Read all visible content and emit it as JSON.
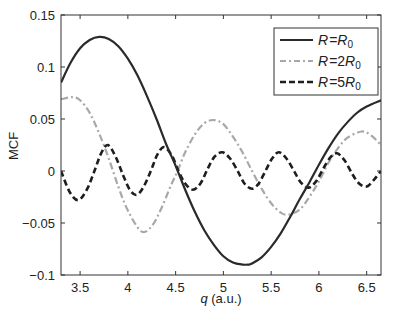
{
  "chart_data": {
    "type": "line",
    "title": "",
    "xlabel": "q (a.u.)",
    "ylabel": "MCF",
    "xlim": [
      3.3,
      6.65
    ],
    "ylim": [
      -0.1,
      0.15
    ],
    "xticks": [
      3.5,
      4,
      4.5,
      5,
      5.5,
      6,
      6.5
    ],
    "xtick_labels": [
      "3.5",
      "4",
      "4.5",
      "5",
      "5.5",
      "6",
      "6.5"
    ],
    "yticks": [
      -0.1,
      -0.05,
      0,
      0.05,
      0.1,
      0.15
    ],
    "ytick_labels": [
      "−0.1",
      "−0.05",
      "0",
      "0.05",
      "0.1",
      "0.15"
    ],
    "grid": false,
    "legend_position": "upper right",
    "series": [
      {
        "name": "R = R0",
        "legend_label": "R = R",
        "legend_sub": "0",
        "legend_prefix": "",
        "style": "solid",
        "color": "#2a2a2a",
        "x": [
          3.3,
          3.4,
          3.5,
          3.6,
          3.7,
          3.8,
          3.9,
          4.0,
          4.1,
          4.2,
          4.3,
          4.4,
          4.5,
          4.6,
          4.7,
          4.8,
          4.9,
          5.0,
          5.1,
          5.2,
          5.26,
          5.3,
          5.4,
          5.5,
          5.6,
          5.7,
          5.8,
          5.9,
          6.0,
          6.1,
          6.2,
          6.3,
          6.4,
          6.5,
          6.65
        ],
        "y": [
          0.085,
          0.104,
          0.118,
          0.126,
          0.129,
          0.127,
          0.12,
          0.108,
          0.092,
          0.072,
          0.05,
          0.026,
          0.005,
          -0.018,
          -0.039,
          -0.057,
          -0.071,
          -0.082,
          -0.088,
          -0.09,
          -0.09,
          -0.089,
          -0.083,
          -0.073,
          -0.06,
          -0.044,
          -0.027,
          -0.011,
          0.006,
          0.022,
          0.036,
          0.047,
          0.056,
          0.062,
          0.068
        ]
      },
      {
        "name": "R = 2R0",
        "legend_label": "R = 2R",
        "legend_sub": "0",
        "style": "dashdot",
        "color": "#a8a8a8",
        "x": [
          3.3,
          3.42,
          3.5,
          3.6,
          3.7,
          3.8,
          3.9,
          4.0,
          4.14,
          4.25,
          4.35,
          4.45,
          4.52,
          4.6,
          4.7,
          4.8,
          4.9,
          5.0,
          5.1,
          5.2,
          5.3,
          5.4,
          5.5,
          5.6,
          5.68,
          5.8,
          5.9,
          6.0,
          6.1,
          6.2,
          6.3,
          6.45,
          6.55,
          6.65
        ],
        "y": [
          0.069,
          0.071,
          0.068,
          0.056,
          0.036,
          0.012,
          -0.015,
          -0.038,
          -0.058,
          -0.053,
          -0.036,
          -0.014,
          0.0,
          0.018,
          0.035,
          0.046,
          0.049,
          0.045,
          0.033,
          0.018,
          0.0,
          -0.017,
          -0.031,
          -0.04,
          -0.042,
          -0.037,
          -0.025,
          -0.01,
          0.008,
          0.022,
          0.032,
          0.038,
          0.034,
          0.025
        ]
      },
      {
        "name": "R = 5R0",
        "legend_label": "R = 5R",
        "legend_sub": "0",
        "style": "dashed",
        "color": "#1e1e1e",
        "x": [
          3.3,
          3.39,
          3.48,
          3.57,
          3.65,
          3.72,
          3.79,
          3.87,
          3.95,
          4.02,
          4.09,
          4.16,
          4.24,
          4.31,
          4.38,
          4.46,
          4.53,
          4.6,
          4.68,
          4.76,
          4.84,
          4.91,
          4.99,
          5.07,
          5.15,
          5.22,
          5.3,
          5.37,
          5.44,
          5.51,
          5.58,
          5.66,
          5.74,
          5.81,
          5.89,
          5.97,
          6.05,
          6.12,
          6.19,
          6.27,
          6.35,
          6.42,
          6.5,
          6.58,
          6.65
        ],
        "y": [
          0.0,
          -0.02,
          -0.028,
          -0.018,
          0.0,
          0.017,
          0.025,
          0.014,
          -0.004,
          -0.018,
          -0.023,
          -0.016,
          0.0,
          0.016,
          0.023,
          0.015,
          0.0,
          -0.012,
          -0.018,
          -0.012,
          0.003,
          0.014,
          0.018,
          0.012,
          0.0,
          -0.012,
          -0.017,
          -0.012,
          0.0,
          0.012,
          0.018,
          0.012,
          0.0,
          -0.011,
          -0.016,
          -0.01,
          0.003,
          0.013,
          0.017,
          0.01,
          -0.003,
          -0.012,
          -0.015,
          -0.008,
          0.0
        ]
      }
    ]
  },
  "legend": {
    "items": [
      {
        "label": "R = R",
        "sub": "0"
      },
      {
        "label": "R = 2R",
        "sub": "0"
      },
      {
        "label": "R = 5R",
        "sub": "0"
      }
    ]
  },
  "axes": {
    "xlabel_italic": "q",
    "xlabel_rest": " (a.u.)",
    "ylabel": "MCF"
  }
}
